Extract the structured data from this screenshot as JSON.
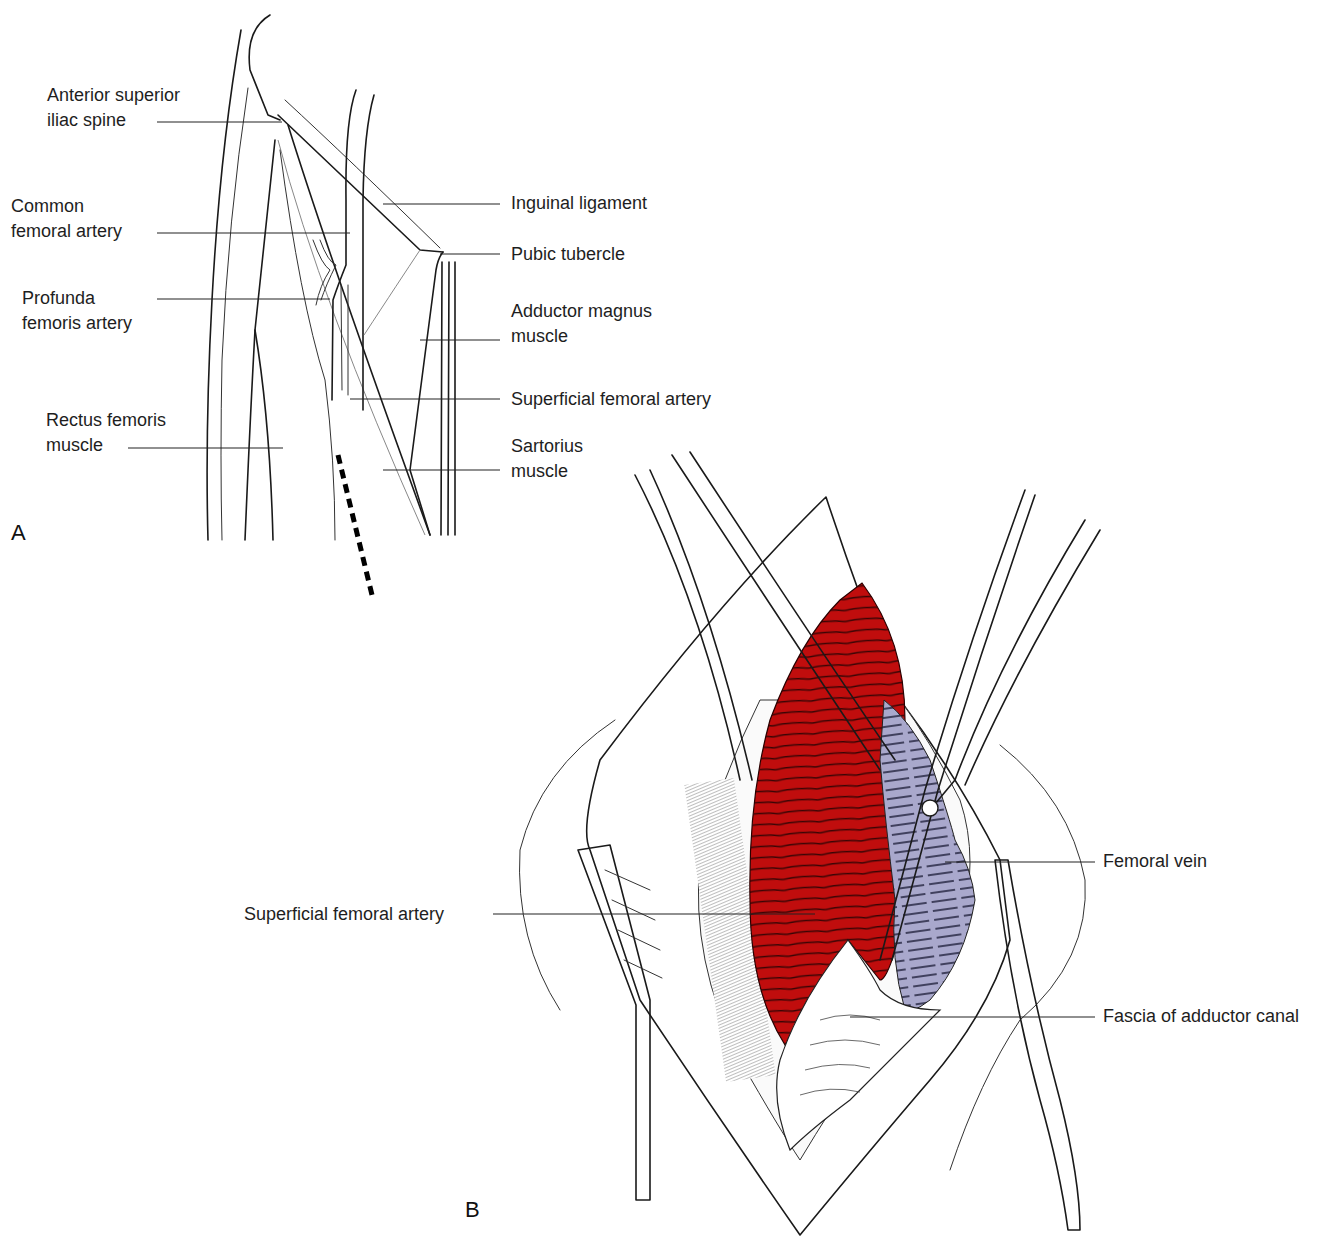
{
  "figure": {
    "colors": {
      "artery": "#c00d0d",
      "vein": "#a9a8cc",
      "ink": "#1a1a1a",
      "background": "#ffffff"
    },
    "panels": [
      {
        "letter": "A",
        "labels": [
          {
            "id": "asis",
            "lines": [
              "Anterior superior",
              "iliac spine"
            ]
          },
          {
            "id": "cfa",
            "lines": [
              "Common",
              "femoral artery"
            ]
          },
          {
            "id": "pfa",
            "lines": [
              "Profunda",
              "femoris artery"
            ]
          },
          {
            "id": "rectus",
            "lines": [
              "Rectus femoris",
              "muscle"
            ]
          },
          {
            "id": "inguinal",
            "lines": [
              "Inguinal ligament"
            ]
          },
          {
            "id": "pubic",
            "lines": [
              "Pubic tubercle"
            ]
          },
          {
            "id": "adductor",
            "lines": [
              "Adductor magnus",
              "muscle"
            ]
          },
          {
            "id": "sfa",
            "lines": [
              "Superficial femoral artery"
            ]
          },
          {
            "id": "sartorius",
            "lines": [
              "Sartorius",
              "muscle"
            ]
          }
        ],
        "incision_marker": "dashed incision line"
      },
      {
        "letter": "B",
        "labels": [
          {
            "id": "sfa",
            "lines": [
              "Superficial femoral artery"
            ]
          },
          {
            "id": "fem_vein",
            "lines": [
              "Femoral vein"
            ]
          },
          {
            "id": "fascia",
            "lines": [
              "Fascia of adductor canal"
            ]
          }
        ]
      }
    ]
  }
}
